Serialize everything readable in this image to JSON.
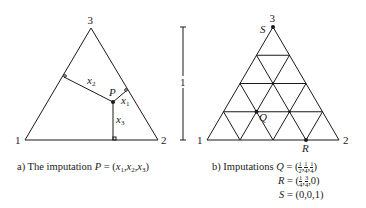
{
  "panel_a": {
    "vertices": {
      "v1": "1",
      "v2": "2",
      "v3": "3"
    },
    "point_label": "P",
    "segments": {
      "x1": "x",
      "x1_sub": "1",
      "x2": "x",
      "x2_sub": "2",
      "x3": "x",
      "x3_sub": "3"
    },
    "caption": {
      "prefix": "a)  The imputation ",
      "var": "P",
      "eq": " = (",
      "x1": "x",
      "s1": "1",
      "c1": ",",
      "x2": "x",
      "s2": "2",
      "c2": ",",
      "x3": "x",
      "s3": "3",
      "close": ")"
    }
  },
  "scale_bar": {
    "label": "1"
  },
  "panel_b": {
    "vertices": {
      "v1": "1",
      "v2": "2",
      "v3": "3"
    },
    "grid_divisions": 4,
    "points": [
      {
        "label": "Q",
        "coords": [
          "1/2",
          "1/4",
          "1/4"
        ]
      },
      {
        "label": "R",
        "coords": [
          "1/4",
          "3/4",
          "0"
        ]
      },
      {
        "label": "S",
        "coords": [
          "0",
          "0",
          "1"
        ]
      }
    ],
    "caption": {
      "prefix": "b)  Imputations ",
      "q_label": "Q",
      "q_eq": " = (",
      "q1n": "1",
      "q1d": "2",
      "q2n": "1",
      "q2d": "4",
      "q3n": "1",
      "q3d": "4",
      "r_label": "R",
      "r_eq": " = (",
      "r1n": "1",
      "r1d": "4",
      "r2n": "3",
      "r2d": "4",
      "r3": "0",
      "s_label": "S",
      "s_eq": " = (0,0,1)",
      "comma": ",",
      "close": ")"
    }
  }
}
